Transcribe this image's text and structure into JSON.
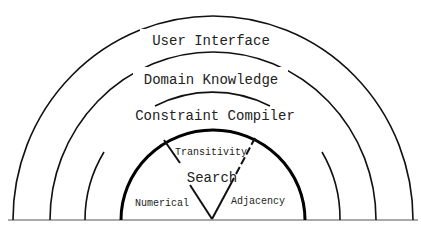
{
  "diagram": {
    "type": "nested-semicircle-layers",
    "layers": [
      {
        "label": "User Interface"
      },
      {
        "label": "Domain Knowledge"
      },
      {
        "label": "Constraint Compiler"
      },
      {
        "label": "Search"
      }
    ],
    "core_segments": [
      {
        "label": "Transitivity"
      },
      {
        "label": "Numerical"
      },
      {
        "label": "Adjacency"
      }
    ],
    "colors": {
      "line": "#111111",
      "text": "#222222",
      "background": "#ffffff"
    }
  }
}
